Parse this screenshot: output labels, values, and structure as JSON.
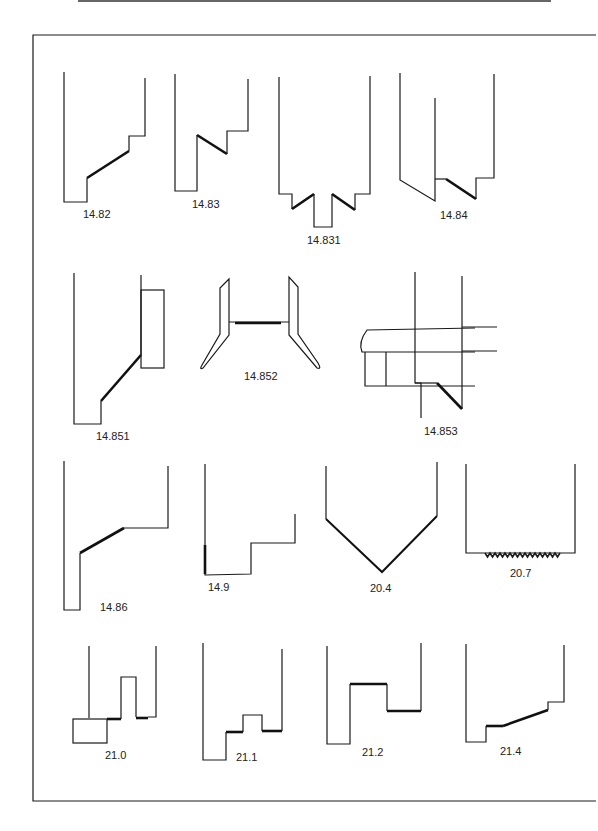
{
  "figure": {
    "border": {
      "left": 33,
      "top": 35,
      "right": 596,
      "bottom": 801
    },
    "top_rule": {
      "x1": 78,
      "x2": 551,
      "y": 1
    },
    "profiles": [
      {
        "id": "14.82",
        "label": "14.82"
      },
      {
        "id": "14.83",
        "label": "14.83"
      },
      {
        "id": "14.831",
        "label": "14.831"
      },
      {
        "id": "14.84",
        "label": "14.84"
      },
      {
        "id": "14.851",
        "label": "14.851"
      },
      {
        "id": "14.852",
        "label": "14.852"
      },
      {
        "id": "14.853",
        "label": "14.853"
      },
      {
        "id": "14.86",
        "label": "14.86"
      },
      {
        "id": "14.9",
        "label": "14.9"
      },
      {
        "id": "20.4",
        "label": "20.4"
      },
      {
        "id": "20.7",
        "label": "20.7"
      },
      {
        "id": "21.0",
        "label": "21.0"
      },
      {
        "id": "21.1",
        "label": "21.1"
      },
      {
        "id": "21.2",
        "label": "21.2"
      },
      {
        "id": "21.4",
        "label": "21.4"
      }
    ]
  }
}
